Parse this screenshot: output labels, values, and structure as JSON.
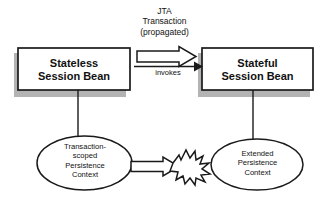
{
  "diagram": {
    "title_note": "JTA transaction propagation between session beans and persistence contexts",
    "colors": {
      "stroke": "#1a1a1a",
      "fill": "#ffffff",
      "shadow": "#b3b3b3",
      "text": "#111111",
      "background": "#ffffff"
    },
    "nodes": {
      "stateless_bean": {
        "label": "Stateless\nSession Bean",
        "shape": "rectangle"
      },
      "stateful_bean": {
        "label": "Stateful\nSession Bean",
        "shape": "rectangle"
      },
      "transaction_scoped_context": {
        "label": "Transaction-\nscoped\nPersistence\nContext",
        "shape": "ellipse"
      },
      "extended_context": {
        "label": "Extended\nPersistence\nContext",
        "shape": "ellipse"
      }
    },
    "edges": {
      "jta_transaction": {
        "label": "JTA\nTransaction\n(propagated)",
        "style": "block-arrow",
        "from": "stateless_bean",
        "to": "stateful_bean"
      },
      "invokes": {
        "label": "invokes",
        "style": "line-arrow",
        "from": "stateless_bean",
        "to": "stateful_bean"
      },
      "context_conflict": {
        "label": "",
        "style": "block-arrow-to-starburst",
        "from": "transaction_scoped_context",
        "to": "extended_context"
      },
      "stateless_to_tx_context": {
        "label": "",
        "style": "plain-line"
      },
      "stateful_to_extended_context": {
        "label": "",
        "style": "plain-line"
      }
    }
  }
}
